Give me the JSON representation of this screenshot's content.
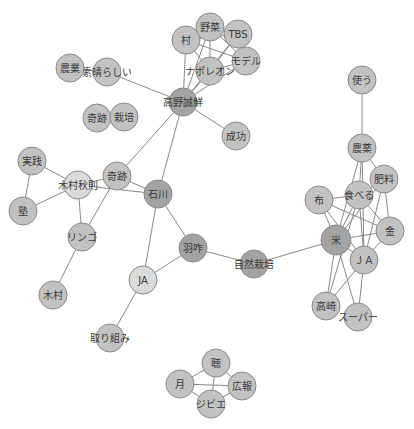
{
  "graph": {
    "type": "co-occurrence network",
    "colors": {
      "light": "#dadada",
      "mid": "#c2c2c2",
      "dark": "#a3a3a3",
      "edge": "#7a7a7a"
    },
    "nodes": [
      {
        "id": "村",
        "x": 186,
        "y": 40,
        "r": 14,
        "shade": "mid"
      },
      {
        "id": "野菜",
        "x": 210,
        "y": 27,
        "r": 14,
        "shade": "mid"
      },
      {
        "id": "TBS",
        "x": 238,
        "y": 34,
        "r": 14,
        "shade": "mid"
      },
      {
        "id": "モデル",
        "x": 246,
        "y": 61,
        "r": 14,
        "shade": "mid"
      },
      {
        "id": "ナポレオン",
        "x": 210,
        "y": 71,
        "r": 14,
        "shade": "mid"
      },
      {
        "id": "農業",
        "x": 70,
        "y": 68,
        "r": 14,
        "shade": "mid"
      },
      {
        "id": "素晴らしい",
        "x": 107,
        "y": 72,
        "r": 14,
        "shade": "mid"
      },
      {
        "id": "高野誠鮮",
        "x": 183,
        "y": 102,
        "r": 14,
        "shade": "dark"
      },
      {
        "id": "奇跡_1",
        "label": "奇跡",
        "x": 97,
        "y": 118,
        "r": 14,
        "shade": "mid"
      },
      {
        "id": "栽培",
        "x": 124,
        "y": 117,
        "r": 14,
        "shade": "mid"
      },
      {
        "id": "成功",
        "x": 236,
        "y": 136,
        "r": 14,
        "shade": "mid"
      },
      {
        "id": "実践",
        "x": 32,
        "y": 161,
        "r": 14,
        "shade": "mid"
      },
      {
        "id": "木村秋則",
        "x": 78,
        "y": 185,
        "r": 14,
        "shade": "light"
      },
      {
        "id": "奇跡",
        "x": 117,
        "y": 176,
        "r": 14,
        "shade": "mid"
      },
      {
        "id": "石川",
        "x": 158,
        "y": 194,
        "r": 14,
        "shade": "dark"
      },
      {
        "id": "塾",
        "x": 23,
        "y": 211,
        "r": 14,
        "shade": "mid"
      },
      {
        "id": "リンゴ",
        "x": 82,
        "y": 237,
        "r": 14,
        "shade": "mid"
      },
      {
        "id": "羽咋",
        "x": 193,
        "y": 248,
        "r": 14,
        "shade": "dark"
      },
      {
        "id": "自然栽培",
        "x": 254,
        "y": 264,
        "r": 14,
        "shade": "dark"
      },
      {
        "id": "JA_left",
        "label": "JA",
        "x": 143,
        "y": 280,
        "r": 14,
        "shade": "light"
      },
      {
        "id": "木村",
        "x": 53,
        "y": 295,
        "r": 14,
        "shade": "mid"
      },
      {
        "id": "取り組み",
        "x": 110,
        "y": 338,
        "r": 14,
        "shade": "mid"
      },
      {
        "id": "聴",
        "x": 216,
        "y": 363,
        "r": 14,
        "shade": "mid"
      },
      {
        "id": "月",
        "x": 180,
        "y": 384,
        "r": 14,
        "shade": "mid"
      },
      {
        "id": "広報",
        "x": 242,
        "y": 386,
        "r": 14,
        "shade": "mid"
      },
      {
        "id": "ジビエ",
        "x": 211,
        "y": 404,
        "r": 14,
        "shade": "mid"
      },
      {
        "id": "使う",
        "x": 362,
        "y": 80,
        "r": 14,
        "shade": "mid"
      },
      {
        "id": "農薬",
        "x": 362,
        "y": 148,
        "r": 14,
        "shade": "mid"
      },
      {
        "id": "肥料",
        "x": 384,
        "y": 179,
        "r": 14,
        "shade": "mid"
      },
      {
        "id": "布",
        "x": 319,
        "y": 200,
        "r": 14,
        "shade": "mid"
      },
      {
        "id": "食べる",
        "x": 359,
        "y": 195,
        "r": 14,
        "shade": "mid"
      },
      {
        "id": "金",
        "x": 390,
        "y": 231,
        "r": 14,
        "shade": "mid"
      },
      {
        "id": "米",
        "x": 336,
        "y": 240,
        "r": 15,
        "shade": "dark"
      },
      {
        "id": "JA_right",
        "label": "ＪＡ",
        "x": 364,
        "y": 260,
        "r": 14,
        "shade": "mid"
      },
      {
        "id": "高崎",
        "x": 326,
        "y": 306,
        "r": 14,
        "shade": "mid"
      },
      {
        "id": "スーパー",
        "x": 358,
        "y": 317,
        "r": 14,
        "shade": "mid"
      }
    ],
    "edges": [
      [
        "村",
        "野菜"
      ],
      [
        "村",
        "TBS"
      ],
      [
        "村",
        "モデル"
      ],
      [
        "村",
        "ナポレオン"
      ],
      [
        "村",
        "高野誠鮮"
      ],
      [
        "野菜",
        "TBS"
      ],
      [
        "野菜",
        "モデル"
      ],
      [
        "野菜",
        "ナポレオン"
      ],
      [
        "野菜",
        "高野誠鮮"
      ],
      [
        "TBS",
        "モデル"
      ],
      [
        "TBS",
        "ナポレオン"
      ],
      [
        "TBS",
        "高野誠鮮"
      ],
      [
        "モデル",
        "ナポレオン"
      ],
      [
        "モデル",
        "高野誠鮮"
      ],
      [
        "ナポレオン",
        "高野誠鮮"
      ],
      [
        "農業",
        "素晴らしい"
      ],
      [
        "素晴らしい",
        "高野誠鮮"
      ],
      [
        "高野誠鮮",
        "成功"
      ],
      [
        "高野誠鮮",
        "奇跡"
      ],
      [
        "高野誠鮮",
        "石川"
      ],
      [
        "奇跡_1",
        "栽培"
      ],
      [
        "実践",
        "木村秋則"
      ],
      [
        "実践",
        "塾"
      ],
      [
        "塾",
        "木村秋則"
      ],
      [
        "木村秋則",
        "奇跡"
      ],
      [
        "木村秋則",
        "石川"
      ],
      [
        "木村秋則",
        "リンゴ"
      ],
      [
        "奇跡",
        "石川"
      ],
      [
        "奇跡",
        "リンゴ"
      ],
      [
        "リンゴ",
        "木村"
      ],
      [
        "石川",
        "羽咋"
      ],
      [
        "石川",
        "JA_left"
      ],
      [
        "羽咋",
        "JA_left"
      ],
      [
        "羽咋",
        "自然栽培"
      ],
      [
        "JA_left",
        "取り組み"
      ],
      [
        "自然栽培",
        "米"
      ],
      [
        "聴",
        "月"
      ],
      [
        "聴",
        "広報"
      ],
      [
        "聴",
        "ジビエ"
      ],
      [
        "月",
        "広報"
      ],
      [
        "月",
        "ジビエ"
      ],
      [
        "広報",
        "ジビエ"
      ],
      [
        "使う",
        "農薬"
      ],
      [
        "農薬",
        "肥料"
      ],
      [
        "農薬",
        "食べる"
      ],
      [
        "農薬",
        "米"
      ],
      [
        "農薬",
        "JA_right"
      ],
      [
        "肥料",
        "食べる"
      ],
      [
        "肥料",
        "米"
      ],
      [
        "肥料",
        "金"
      ],
      [
        "肥料",
        "JA_right"
      ],
      [
        "布",
        "食べる"
      ],
      [
        "布",
        "米"
      ],
      [
        "布",
        "金"
      ],
      [
        "布",
        "JA_right"
      ],
      [
        "食べる",
        "米"
      ],
      [
        "食べる",
        "金"
      ],
      [
        "食べる",
        "JA_right"
      ],
      [
        "食べる",
        "高崎"
      ],
      [
        "金",
        "米"
      ],
      [
        "金",
        "JA_right"
      ],
      [
        "米",
        "JA_right"
      ],
      [
        "米",
        "高崎"
      ],
      [
        "米",
        "スーパー"
      ],
      [
        "JA_right",
        "高崎"
      ],
      [
        "JA_right",
        "スーパー"
      ]
    ]
  }
}
